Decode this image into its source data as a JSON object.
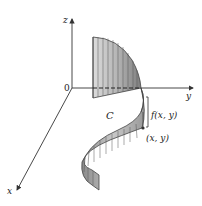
{
  "diagram": {
    "axes": {
      "x_label": "x",
      "y_label": "y",
      "z_label": "z",
      "origin_label": "0"
    },
    "labels": {
      "curve": "C",
      "height": "f(x, y)",
      "point": "(x, y)"
    },
    "colors": {
      "axis": "#333333",
      "curtain_fill_light": "#d4d4d4",
      "curtain_fill_dark": "#8a8a8a",
      "curtain_edge": "#444444",
      "background": "#ffffff"
    }
  }
}
